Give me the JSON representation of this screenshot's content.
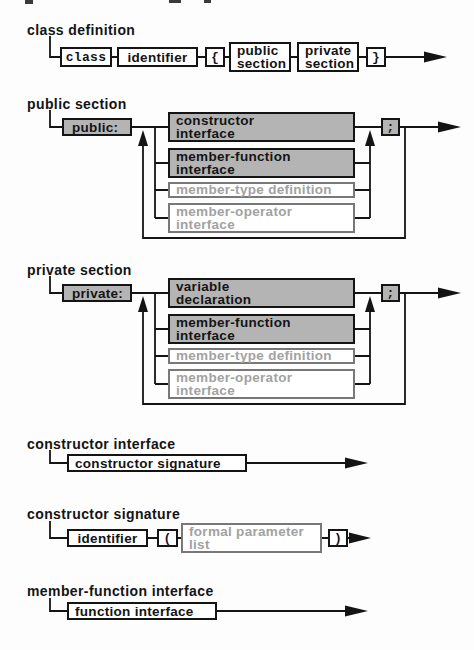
{
  "figure": {
    "kind": "syntax-railroad-diagrams",
    "colors": {
      "line": "#141414",
      "box_border": "#141414",
      "emphasized_fill": "#b4b4b4",
      "optional_border": "#787878",
      "optional_text": "#a2a2a2",
      "background": "#fdfdfd"
    }
  },
  "diagrams": [
    {
      "title": "class definition",
      "nodes": {
        "class": "class",
        "identifier": "identifier",
        "open_brace": "{",
        "public_section": "public\nsection",
        "private_section": "private\nsection",
        "close_brace": "}"
      }
    },
    {
      "title": "public section",
      "entry": "public:",
      "alternatives": [
        {
          "label": "constructor\ninterface",
          "emphasized": true
        },
        {
          "label": "member-function\ninterface",
          "emphasized": true
        },
        {
          "label": "member-type definition",
          "emphasized": false
        },
        {
          "label": "member-operator\ninterface",
          "emphasized": false
        }
      ],
      "separator": ";"
    },
    {
      "title": "private section",
      "entry": "private:",
      "alternatives": [
        {
          "label": "variable\ndeclaration",
          "emphasized": true
        },
        {
          "label": "member-function\ninterface",
          "emphasized": true
        },
        {
          "label": "member-type definition",
          "emphasized": false
        },
        {
          "label": "member-operator\ninterface",
          "emphasized": false
        }
      ],
      "separator": ";"
    },
    {
      "title": "constructor interface",
      "nodes": {
        "constructor_signature": "constructor signature"
      }
    },
    {
      "title": "constructor signature",
      "nodes": {
        "identifier": "identifier",
        "open_paren": "(",
        "formal_parameter_list": "formal parameter\nlist",
        "close_paren": ")"
      }
    },
    {
      "title": "member-function interface",
      "nodes": {
        "function_interface": "function interface"
      }
    }
  ]
}
